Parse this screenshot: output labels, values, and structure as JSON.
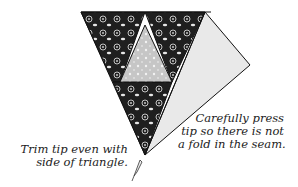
{
  "diagram": {
    "type": "quilting-instruction",
    "colors": {
      "dark_fabric": "#1f1f1f",
      "pattern": "#bdbdbd",
      "center_fabric": "#c8c8c8",
      "light_triangle": "#e9e9e9",
      "outline": "#111111"
    },
    "annotations": {
      "right": {
        "line1": "Carefully press",
        "line2": "tip so there is not",
        "line3": "a fold in the seam."
      },
      "left": {
        "line1": "Trim tip even with",
        "line2": "side of triangle."
      }
    },
    "icons": [
      "scissors-cut-icon"
    ]
  }
}
